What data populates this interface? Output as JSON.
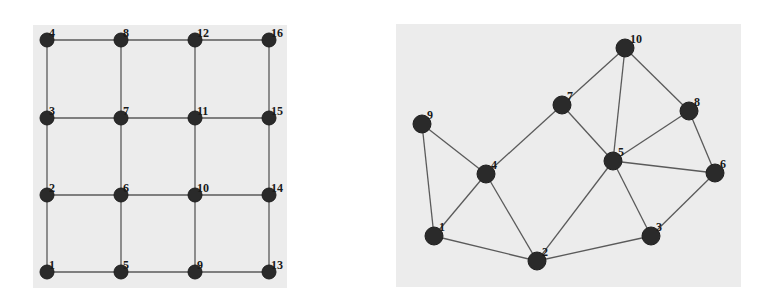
{
  "figures": [
    {
      "id": "grid-graph",
      "type": "grid_graph",
      "panel": {
        "x": 33,
        "y": 25,
        "width": 254,
        "height": 263
      },
      "node_radius": 7,
      "label_font_size": 12,
      "label_offset": [
        2,
        -3
      ],
      "nodes": [
        {
          "id": "1",
          "label": "1",
          "x": 47,
          "y": 272
        },
        {
          "id": "2",
          "label": "2",
          "x": 47,
          "y": 195
        },
        {
          "id": "3",
          "label": "3",
          "x": 47,
          "y": 118
        },
        {
          "id": "4",
          "label": "4",
          "x": 47,
          "y": 40
        },
        {
          "id": "5",
          "label": "5",
          "x": 121,
          "y": 272
        },
        {
          "id": "6",
          "label": "6",
          "x": 121,
          "y": 195
        },
        {
          "id": "7",
          "label": "7",
          "x": 121,
          "y": 118
        },
        {
          "id": "8",
          "label": "8",
          "x": 121,
          "y": 40
        },
        {
          "id": "9",
          "label": "9",
          "x": 195,
          "y": 272
        },
        {
          "id": "10",
          "label": "10",
          "x": 195,
          "y": 195
        },
        {
          "id": "11",
          "label": "11",
          "x": 195,
          "y": 118
        },
        {
          "id": "12",
          "label": "12",
          "x": 195,
          "y": 40
        },
        {
          "id": "13",
          "label": "13",
          "x": 269,
          "y": 272
        },
        {
          "id": "14",
          "label": "14",
          "x": 269,
          "y": 195
        },
        {
          "id": "15",
          "label": "15",
          "x": 269,
          "y": 118
        },
        {
          "id": "16",
          "label": "16",
          "x": 269,
          "y": 40
        }
      ],
      "edges": [
        [
          "1",
          "2"
        ],
        [
          "2",
          "3"
        ],
        [
          "3",
          "4"
        ],
        [
          "5",
          "6"
        ],
        [
          "6",
          "7"
        ],
        [
          "7",
          "8"
        ],
        [
          "9",
          "10"
        ],
        [
          "10",
          "11"
        ],
        [
          "11",
          "12"
        ],
        [
          "13",
          "14"
        ],
        [
          "14",
          "15"
        ],
        [
          "15",
          "16"
        ],
        [
          "1",
          "5"
        ],
        [
          "5",
          "9"
        ],
        [
          "9",
          "13"
        ],
        [
          "2",
          "6"
        ],
        [
          "6",
          "10"
        ],
        [
          "10",
          "14"
        ],
        [
          "3",
          "7"
        ],
        [
          "7",
          "11"
        ],
        [
          "11",
          "15"
        ],
        [
          "4",
          "8"
        ],
        [
          "8",
          "12"
        ],
        [
          "12",
          "16"
        ]
      ]
    },
    {
      "id": "random-graph",
      "type": "planar_graph",
      "panel": {
        "x": 396,
        "y": 24,
        "width": 345,
        "height": 263
      },
      "node_radius": 9,
      "label_font_size": 12,
      "label_offset": [
        5,
        -5
      ],
      "nodes": [
        {
          "id": "1",
          "label": "1",
          "x": 434,
          "y": 236
        },
        {
          "id": "2",
          "label": "2",
          "x": 537,
          "y": 261
        },
        {
          "id": "3",
          "label": "3",
          "x": 651,
          "y": 236
        },
        {
          "id": "4",
          "label": "4",
          "x": 486,
          "y": 174
        },
        {
          "id": "5",
          "label": "5",
          "x": 613,
          "y": 161
        },
        {
          "id": "6",
          "label": "6",
          "x": 715,
          "y": 173
        },
        {
          "id": "7",
          "label": "7",
          "x": 562,
          "y": 105
        },
        {
          "id": "8",
          "label": "8",
          "x": 689,
          "y": 111
        },
        {
          "id": "9",
          "label": "9",
          "x": 422,
          "y": 124
        },
        {
          "id": "10",
          "label": "10",
          "x": 625,
          "y": 48
        }
      ],
      "edges": [
        [
          "9",
          "1"
        ],
        [
          "9",
          "4"
        ],
        [
          "1",
          "4"
        ],
        [
          "1",
          "2"
        ],
        [
          "4",
          "2"
        ],
        [
          "4",
          "7"
        ],
        [
          "2",
          "5"
        ],
        [
          "2",
          "3"
        ],
        [
          "7",
          "10"
        ],
        [
          "7",
          "5"
        ],
        [
          "10",
          "5"
        ],
        [
          "10",
          "8"
        ],
        [
          "8",
          "5"
        ],
        [
          "8",
          "6"
        ],
        [
          "5",
          "6"
        ],
        [
          "5",
          "3"
        ],
        [
          "3",
          "6"
        ]
      ]
    }
  ],
  "colors": {
    "panel_background": "#ececec",
    "edge": "#5a5a5a",
    "node_fill": "#2a2a2a",
    "label": "#1a1a1a"
  }
}
